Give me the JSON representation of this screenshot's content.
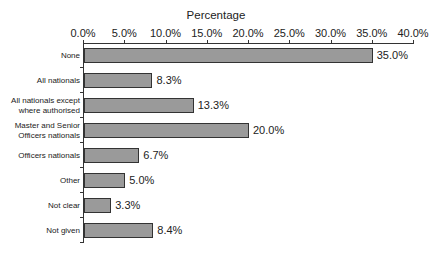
{
  "chart_data": {
    "type": "bar",
    "orientation": "horizontal",
    "title": "",
    "xlabel": "Percentage",
    "ylabel": "",
    "xlim": [
      0,
      40
    ],
    "x_ticks": [
      "0.0%",
      "5.0%",
      "10.0%",
      "15.0%",
      "20.0%",
      "25.0%",
      "30.0%",
      "35.0%",
      "40.0%"
    ],
    "x_axis_position": "top",
    "grid": false,
    "legend": null,
    "categories": [
      "None",
      "All nationals",
      "All nationals except where authorised",
      "Master and Senior Officers nationals",
      "Officers nationals",
      "Other",
      "Not clear",
      "Not given"
    ],
    "category_lines": [
      [
        "None"
      ],
      [
        "All nationals"
      ],
      [
        "All nationals except",
        "where authorised"
      ],
      [
        "Master and Senior",
        "Officers nationals"
      ],
      [
        "Officers nationals"
      ],
      [
        "Other"
      ],
      [
        "Not clear"
      ],
      [
        "Not given"
      ]
    ],
    "values": [
      35.0,
      8.3,
      13.3,
      20.0,
      6.7,
      5.0,
      3.3,
      8.4
    ],
    "value_labels": [
      "35.0%",
      "8.3%",
      "13.3%",
      "20.0%",
      "6.7%",
      "5.0%",
      "3.3%",
      "8.4%"
    ],
    "colors": {
      "bar_fill": "#9a9a9a",
      "bar_border": "#333333",
      "axis": "#333333"
    }
  }
}
